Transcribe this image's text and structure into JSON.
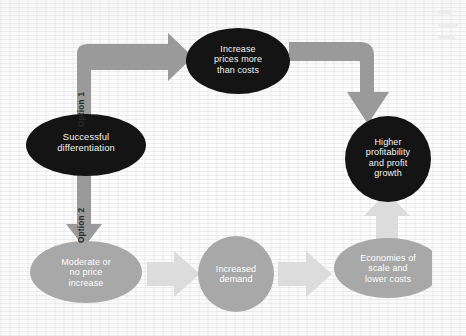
{
  "figure": {
    "type": "flow-diagram",
    "title_visible": false,
    "background_color": "#fbfbfb"
  },
  "palette": {
    "dark_node": "#141414",
    "dark_node_text": "#f2f2f2",
    "gray_node": "#a8a8a8",
    "gray_node_text": "#ffffff",
    "dark_arrow": "#9a9a9a",
    "light_arrow": "#d8d8d8",
    "option_label_text": "#2a2a2a"
  },
  "nodes": [
    {
      "id": "successful-differentiation",
      "label": "Successful\ndifferentiation",
      "shape": "ellipse",
      "style": "dark",
      "font_size": 9.4,
      "cx": 78,
      "cy": 139,
      "rx": 60,
      "ry": 31
    },
    {
      "id": "increase-prices",
      "label": "Increase\nprices more\nthan costs",
      "shape": "ellipse",
      "style": "dark",
      "font_size": 9.0,
      "cx": 230,
      "cy": 55,
      "rx": 52,
      "ry": 33
    },
    {
      "id": "higher-profitability",
      "label": "Higher\nprofitability\nand profit\ngrowth",
      "shape": "circle",
      "style": "dark",
      "font_size": 9.0,
      "cx": 380,
      "cy": 153,
      "rx": 43,
      "ry": 43
    },
    {
      "id": "moderate-or-no-price-increase",
      "label": "Moderate or\nno price\nincrease",
      "shape": "ellipse",
      "style": "gray",
      "font_size": 9.0,
      "cx": 78,
      "cy": 266,
      "rx": 56,
      "ry": 31
    },
    {
      "id": "increased-demand",
      "label": "Increased\ndemand",
      "shape": "circle",
      "style": "gray",
      "font_size": 9.0,
      "cx": 228,
      "cy": 268,
      "rx": 38,
      "ry": 38
    },
    {
      "id": "economies-of-scale",
      "label": "Economies of\nscale and\nlower costs",
      "shape": "ellipse",
      "style": "gray",
      "font_size": 9.0,
      "cx": 380,
      "cy": 262,
      "rx": 54,
      "ry": 30
    }
  ],
  "edges": [
    {
      "id": "option-1-elbow",
      "from": "successful-differentiation",
      "to": "increase-prices",
      "style": "dark",
      "route": "up-then-right",
      "label": "Option 1"
    },
    {
      "id": "prices-to-profit",
      "from": "increase-prices",
      "to": "higher-profitability",
      "style": "dark",
      "route": "right-then-down",
      "label": ""
    },
    {
      "id": "option-2-down",
      "from": "successful-differentiation",
      "to": "moderate-or-no-price-increase",
      "style": "dark",
      "route": "down",
      "label": "Option 2"
    },
    {
      "id": "moderate-to-demand",
      "from": "moderate-or-no-price-increase",
      "to": "increased-demand",
      "style": "light",
      "route": "right",
      "label": ""
    },
    {
      "id": "demand-to-economies",
      "from": "increased-demand",
      "to": "economies-of-scale",
      "style": "light",
      "route": "right",
      "label": ""
    },
    {
      "id": "economies-to-profit",
      "from": "economies-of-scale",
      "to": "higher-profitability",
      "style": "light",
      "route": "up",
      "label": ""
    }
  ],
  "option_labels": [
    {
      "id": "option-1",
      "text": "Option 1",
      "x": 74,
      "y": 112,
      "rotation": -90
    },
    {
      "id": "option-2",
      "text": "Option 2",
      "x": 74,
      "y": 228,
      "rotation": -90
    }
  ]
}
